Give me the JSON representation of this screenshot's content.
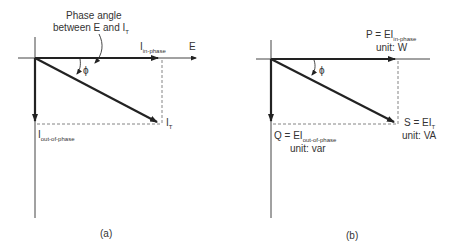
{
  "diagram_a": {
    "caption": "(a)",
    "annotation_line1": "Phase angle",
    "annotation_line2": "between E and I",
    "annotation_sub": "T",
    "in_phase_label": "I",
    "in_phase_sub": "in-phase",
    "e_label": "E",
    "total_label": "I",
    "total_sub": "T",
    "out_phase_label": "I",
    "out_phase_sub": "out-of-phase",
    "angle_symbol": "ϕ"
  },
  "diagram_b": {
    "caption": "(b)",
    "p_label": "P = EI",
    "p_sub": "in-phase",
    "p_unit": "unit: W",
    "s_label": "S = EI",
    "s_sub": "T",
    "s_unit": "unit: VA",
    "q_label": "Q = EI",
    "q_sub": "out-of-phase",
    "q_unit": "unit: var",
    "angle_symbol": "ϕ"
  }
}
